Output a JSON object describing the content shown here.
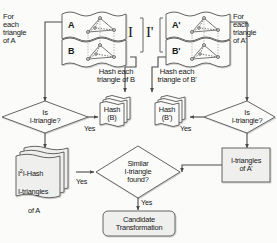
{
  "diagram": {
    "colors": {
      "stroke": "#4a4a4a",
      "fill_light": "#f0f0ef",
      "fill_white": "#fdfdfd",
      "text": "#171717",
      "background": "#fbfbfa"
    },
    "annotations": {
      "for_each_triangle_a": "For\neach\ntriangle\nof  A",
      "for_each_triangle_a_prime": "For\neach\ntriangle\nof  A'",
      "hash_each_triangle_b": "Hash each\ntriangle of B",
      "hash_each_triangle_b_prime": "Hash each\ntriangle of B'",
      "bracket_i": "I",
      "bracket_i_prime": "I'"
    },
    "sheets": [
      {
        "name": "sheet-a",
        "label": "A"
      },
      {
        "name": "sheet-b",
        "label": "B"
      },
      {
        "name": "sheet-a-prime",
        "label": "A'"
      },
      {
        "name": "sheet-b-prime",
        "label": "B'"
      }
    ],
    "nodes": {
      "decision_left": "Is\nI-triangle?",
      "decision_right": "Is\nI-triangle?",
      "hash_b": "Hash\n(B)",
      "hash_b_prime": "Hash\n(B')",
      "i2i_hash_a": "I2I-Hash\nI-triangles\nof A",
      "i2i_hash_a_sup": "2",
      "i2i_hash_a_line1_pre": "I",
      "i2i_hash_a_line1_post": "I-Hash",
      "i2i_hash_a_line2": "I-triangles",
      "i2i_hash_a_line3": "of A",
      "i_triangles_a_prime": "I-triangles\nof A'",
      "similar_found": "Similar\nI-triangle\nfound?",
      "candidate": "Candidate\nTransformation"
    },
    "edge_labels": {
      "yes_left_decision": "Yes",
      "yes_right_decision": "Yes",
      "yes_left_similar": "Yes",
      "yes_right_similar": "Yes",
      "yes_candidate": "Yes"
    }
  }
}
